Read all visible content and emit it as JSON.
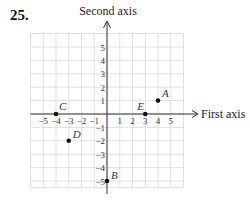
{
  "problem_number": "25.",
  "chart_data": {
    "type": "scatter",
    "title": "",
    "xlabel": "First axis",
    "ylabel": "Second axis",
    "xlim": [
      -6,
      6
    ],
    "ylim": [
      -5.5,
      6
    ],
    "grid": true,
    "x_ticks": [
      -5,
      -4,
      -3,
      -2,
      -1,
      1,
      2,
      3,
      4,
      5
    ],
    "y_ticks": [
      5,
      4,
      3,
      2,
      1,
      -1,
      -2,
      -3,
      -4,
      -5
    ],
    "x_tick_labels": [
      "−5",
      "−4",
      "−3",
      "−2",
      "−1",
      "1",
      "2",
      "3",
      "4",
      "5"
    ],
    "y_tick_labels": [
      "5",
      "4",
      "3",
      "2",
      "1",
      "−1",
      "−2",
      "−3",
      "−4",
      "−5"
    ],
    "points": [
      {
        "label": "A",
        "x": 4,
        "y": 1
      },
      {
        "label": "B",
        "x": 0,
        "y": -5
      },
      {
        "label": "C",
        "x": -4,
        "y": 0
      },
      {
        "label": "D",
        "x": -3,
        "y": -2
      },
      {
        "label": "E",
        "x": 3,
        "y": 0
      }
    ],
    "legend": null
  },
  "colors": {
    "grid": "#d8d8d8",
    "axis": "#333333",
    "point": "#111111"
  }
}
